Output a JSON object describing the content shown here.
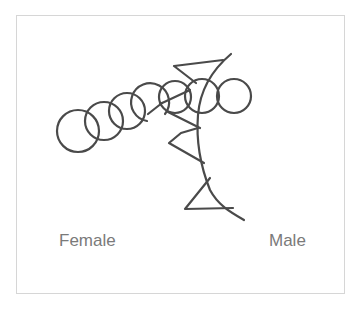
{
  "figure": {
    "labels": {
      "female": "Female",
      "male": "Male"
    },
    "symbols": {
      "female": "chain-of-circles-icon",
      "male": "curved-line-with-triangles-icon"
    },
    "colors": {
      "stroke": "#4a4a4a",
      "label": "#7a7a7a",
      "border": "#d6d6d6",
      "background": "#ffffff"
    }
  }
}
